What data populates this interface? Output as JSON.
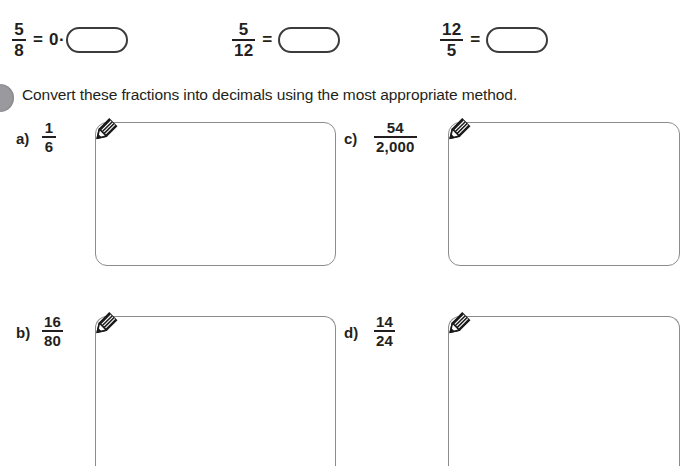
{
  "page": {
    "question_badge": "question-number-badge",
    "instruction": "Convert these fractions into decimals using the most appropriate method."
  },
  "top_prompts": [
    {
      "id": "prompt-1",
      "numerator": "5",
      "denominator": "8",
      "equals": "=",
      "prefix": "0·",
      "answer_value": "",
      "answer_placeholder": ""
    },
    {
      "id": "prompt-2",
      "numerator": "5",
      "denominator": "12",
      "equals": "=",
      "prefix": "",
      "answer_value": "",
      "answer_placeholder": ""
    },
    {
      "id": "prompt-3",
      "numerator": "12",
      "denominator": "5",
      "equals": "=",
      "prefix": "",
      "answer_value": "",
      "answer_placeholder": ""
    }
  ],
  "work_items": [
    {
      "id": "item-a",
      "label": "a)",
      "numerator": "1",
      "denominator": "6",
      "working_value": "",
      "icon": "pencil-icon"
    },
    {
      "id": "item-c",
      "label": "c)",
      "numerator": "54",
      "denominator": "2,000",
      "working_value": "",
      "icon": "pencil-icon"
    },
    {
      "id": "item-b",
      "label": "b)",
      "numerator": "16",
      "denominator": "80",
      "working_value": "",
      "icon": "pencil-icon"
    },
    {
      "id": "item-d",
      "label": "d)",
      "numerator": "14",
      "denominator": "24",
      "working_value": "",
      "icon": "pencil-icon"
    }
  ],
  "colors": {
    "text": "#231f20",
    "box_border_small": "#3b3b3d",
    "box_border_large": "#8c8c90",
    "badge": "#9a9a9e",
    "pencil_body": "#1a1a1a",
    "page_background": "#ffffff"
  }
}
